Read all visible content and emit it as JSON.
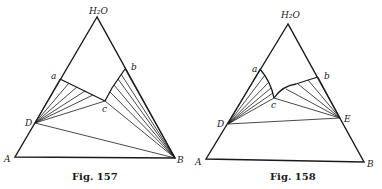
{
  "figures": [
    {
      "id": "fig157",
      "caption": "Fig. 157",
      "labels": {
        "apex": "H₂O",
        "A": "A",
        "B": "B",
        "a": "a",
        "b": "b",
        "c": "c",
        "D": "D"
      },
      "points": {
        "apex": [
          97,
          17
        ],
        "A": [
          15,
          157
        ],
        "B": [
          175,
          158
        ],
        "a": [
          60,
          79
        ],
        "b": [
          125,
          69
        ],
        "c": [
          105,
          101
        ],
        "D": [
          35,
          123
        ]
      }
    },
    {
      "id": "fig158",
      "caption": "Fig. 158",
      "labels": {
        "apex": "H₂O",
        "A": "A",
        "B": "B",
        "a": "a",
        "b": "b",
        "c": "c",
        "D": "D",
        "E": "E"
      },
      "points": {
        "apex": [
          288,
          24
        ],
        "A": [
          206,
          159
        ],
        "B": [
          364,
          162
        ],
        "a": [
          260,
          69
        ],
        "b": [
          318,
          77
        ],
        "c": [
          274,
          98
        ],
        "D": [
          228,
          124
        ],
        "E": [
          340,
          118
        ]
      }
    }
  ]
}
